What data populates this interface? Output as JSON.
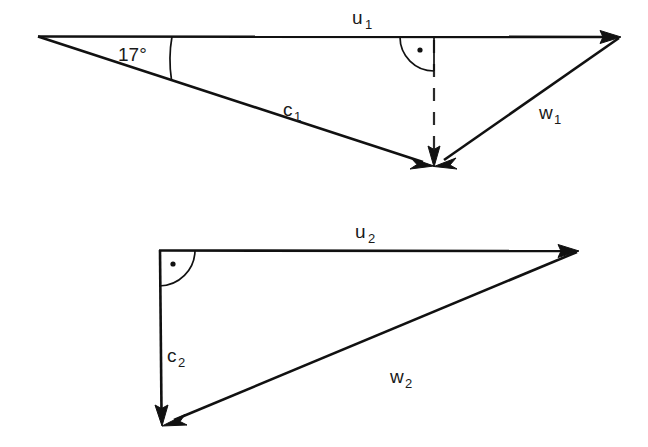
{
  "figure": {
    "background_color": "#ffffff",
    "line_color": "#111111"
  },
  "triangles": [
    {
      "id": "triangle-1",
      "angle_label": "17°",
      "vectors": [
        {
          "name": "u1",
          "base": "u",
          "subscript": "1",
          "label_x": 352,
          "label_y": 24
        },
        {
          "name": "c1",
          "base": "c",
          "subscript": "1",
          "label_x": 283,
          "label_y": 116
        },
        {
          "name": "w1",
          "base": "w",
          "subscript": "1",
          "label_x": 539,
          "label_y": 119
        }
      ],
      "has_right_angle_marker": true,
      "has_dashed_projection": true
    },
    {
      "id": "triangle-2",
      "angle_label": "",
      "vectors": [
        {
          "name": "u2",
          "base": "u",
          "subscript": "2",
          "label_x": 355,
          "label_y": 238
        },
        {
          "name": "c2",
          "base": "c",
          "subscript": "2",
          "label_x": 167,
          "label_y": 362
        },
        {
          "name": "w2",
          "base": "w",
          "subscript": "2",
          "label_x": 399,
          "label_y": 383
        }
      ],
      "has_right_angle_marker": true,
      "has_dashed_projection": false
    }
  ],
  "labels": {
    "u1": "u",
    "u1_sub": "1",
    "c1": "c",
    "c1_sub": "1",
    "w1": "w",
    "w1_sub": "1",
    "u2": "u",
    "u2_sub": "2",
    "c2": "c",
    "c2_sub": "2",
    "w2": "w",
    "w2_sub": "2",
    "angle_17": "17°"
  }
}
